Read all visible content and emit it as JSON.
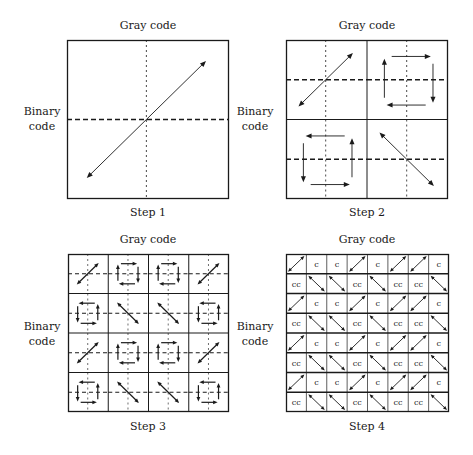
{
  "panels": [
    {
      "id": "step1",
      "top_label": "Gray code",
      "side_label": [
        "Binary",
        "code"
      ],
      "step_label": "Step 1",
      "grid": 1,
      "cells": [
        [
          "diag"
        ]
      ]
    },
    {
      "id": "step2",
      "top_label": "Gray code",
      "side_label": [
        "Binary",
        "code"
      ],
      "step_label": "Step 2",
      "grid": 2,
      "cells": [
        [
          "diag",
          "cw"
        ],
        [
          "ccw",
          "anti"
        ]
      ]
    },
    {
      "id": "step3",
      "top_label": "Gray code",
      "side_label": [
        "Binary",
        "code"
      ],
      "step_label": "Step 3",
      "grid": 4,
      "cells": [
        [
          "diag",
          "cw",
          "cw",
          "diag"
        ],
        [
          "ccw",
          "anti",
          "anti",
          "ccw"
        ],
        [
          "diag",
          "cw",
          "cw",
          "diag"
        ],
        [
          "ccw",
          "anti",
          "anti",
          "ccw"
        ]
      ]
    },
    {
      "id": "step4",
      "top_label": "Gray code",
      "side_label": [
        "Binary",
        "code"
      ],
      "step_label": "Step 4",
      "grid": 8,
      "cell_text": {
        "cw": "c",
        "ccw": "cc"
      },
      "cells": [
        [
          "diag",
          "cw",
          "cw",
          "diag",
          "cw",
          "diag",
          "diag",
          "cw"
        ],
        [
          "ccw",
          "anti",
          "anti",
          "ccw",
          "anti",
          "ccw",
          "ccw",
          "anti"
        ],
        [
          "diag",
          "cw",
          "cw",
          "diag",
          "cw",
          "diag",
          "diag",
          "cw"
        ],
        [
          "ccw",
          "anti",
          "anti",
          "ccw",
          "anti",
          "ccw",
          "ccw",
          "anti"
        ],
        [
          "diag",
          "cw",
          "cw",
          "diag",
          "cw",
          "diag",
          "diag",
          "cw"
        ],
        [
          "ccw",
          "anti",
          "anti",
          "ccw",
          "anti",
          "ccw",
          "ccw",
          "anti"
        ],
        [
          "diag",
          "cw",
          "cw",
          "diag",
          "cw",
          "diag",
          "diag",
          "cw"
        ],
        [
          "ccw",
          "anti",
          "anti",
          "ccw",
          "anti",
          "ccw",
          "ccw",
          "anti"
        ]
      ]
    }
  ],
  "legend": {
    "diag": "double-arrow-diagonal-icon",
    "anti": "double-arrow-antidiagonal-icon",
    "cw": "clockwise-cycle-icon",
    "ccw": "counterclockwise-cycle-icon"
  }
}
